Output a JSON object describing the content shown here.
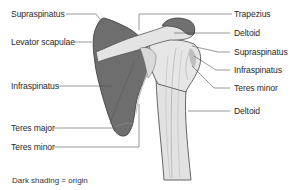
{
  "diagram": {
    "colors": {
      "origin_shading": "#6e6e6e",
      "bone": "#e2e2e2",
      "bone_outline": "#555555",
      "leader_line": "#555555",
      "text": "#2a2a2a"
    },
    "labels_left": [
      {
        "id": "supraspinatus-left",
        "text": "Supraspinatus"
      },
      {
        "id": "levator-scapulae",
        "text": "Levator scapulae"
      },
      {
        "id": "infraspinatus-left",
        "text": "Infraspinatus"
      },
      {
        "id": "teres-major",
        "text": "Teres major"
      },
      {
        "id": "teres-minor-left",
        "text": "Teres minor"
      }
    ],
    "labels_right": [
      {
        "id": "trapezius",
        "text": "Trapezius"
      },
      {
        "id": "deltoid-top",
        "text": "Deltoid"
      },
      {
        "id": "supraspinatus-right",
        "text": "Supraspinatus"
      },
      {
        "id": "infraspinatus-right",
        "text": "Infraspinatus"
      },
      {
        "id": "teres-minor-right",
        "text": "Teres minor"
      },
      {
        "id": "deltoid-bottom",
        "text": "Deltoid"
      }
    ],
    "caption": "Dark shading = origin"
  }
}
